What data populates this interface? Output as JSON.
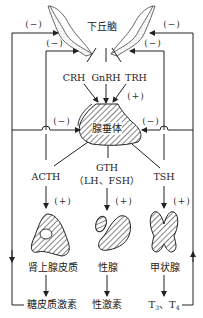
{
  "diagram": {
    "type": "hypothalamus-pituitary-target-gland feedback axis",
    "nodes": {
      "hypothalamus": "下丘脑",
      "pituitary": "腺垂体",
      "adrenal_cortex": "肾上腺皮质",
      "gonad": "性腺",
      "thyroid": "甲状腺",
      "glucocorticoid": "糖皮质激素",
      "sex_hormone": "性激素",
      "thyroid_hormone_t3": "T",
      "thyroid_hormone_t3_sub": "3",
      "thyroid_hormone_sep": "、",
      "thyroid_hormone_t4": "T",
      "thyroid_hormone_t4_sub": "4"
    },
    "releasing_hormones": {
      "crh": "CRH",
      "gnrh": "GnRH",
      "trh": "TRH"
    },
    "tropic_hormones": {
      "acth": "ACTH",
      "gth": "GTH",
      "gth_detail": "（LH、FSH）",
      "tsh": "TSH"
    },
    "signs": {
      "stimulate": "(+)",
      "inhibit": "(−)"
    },
    "edges": [
      {
        "from": "hypothalamus",
        "to": "pituitary",
        "via": [
          "CRH",
          "GnRH",
          "TRH"
        ],
        "sign": "+"
      },
      {
        "from": "pituitary",
        "to": "adrenal_cortex",
        "via": "ACTH",
        "sign": "+"
      },
      {
        "from": "pituitary",
        "to": "gonad",
        "via": "GTH",
        "sign": "+"
      },
      {
        "from": "pituitary",
        "to": "thyroid",
        "via": "TSH",
        "sign": "+"
      },
      {
        "from": "adrenal_cortex",
        "to": "glucocorticoid"
      },
      {
        "from": "gonad",
        "to": "sex_hormone"
      },
      {
        "from": "thyroid",
        "to": "T3, T4"
      },
      {
        "from": "glucocorticoid",
        "to": "hypothalamus",
        "sign": "-"
      },
      {
        "from": "glucocorticoid",
        "to": "pituitary",
        "sign": "-"
      },
      {
        "from": "T3, T4",
        "to": "hypothalamus",
        "sign": "-"
      },
      {
        "from": "T3, T4",
        "to": "pituitary",
        "sign": "-"
      }
    ]
  }
}
